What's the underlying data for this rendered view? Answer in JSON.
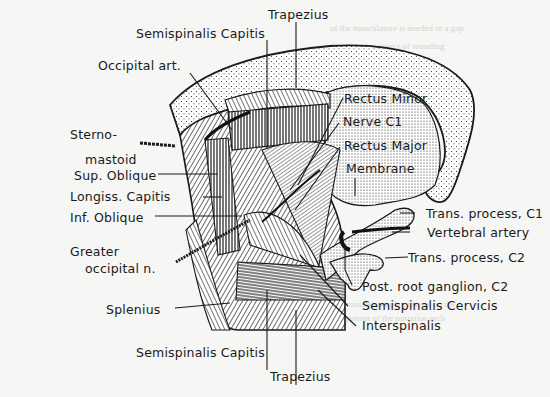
{
  "figure": {
    "labels": {
      "trapezius_top": "Trapezius",
      "semispinalis_capitis_top": "Semispinalis Capitis",
      "occipital_art": "Occipital art.",
      "sternomastoid_1": "Sterno-",
      "sternomastoid_2": "mastoid",
      "sup_oblique": "Sup. Oblique",
      "longiss_capitis": "Longiss. Capitis",
      "inf_oblique": "Inf. Oblique",
      "greater_occipital_1": "Greater",
      "greater_occipital_2": "occipital n.",
      "splenius": "Splenius",
      "semispinalis_capitis_bottom": "Semispinalis Capitis",
      "trapezius_bottom": "Trapezius",
      "rectus_minor": "Rectus Minor",
      "nerve_c1": "Nerve C1",
      "rectus_major": "Rectus Major",
      "membrane": "Membrane",
      "trans_process_c1": "Trans. process, C1",
      "vertebral_artery": "Vertebral artery",
      "trans_process_c2": "Trans. process, C2",
      "post_root_ganglion": "Post. root ganglion, C2",
      "semispinalis_cervicis": "Semispinalis Cervicis",
      "interspinalis": "Interspinalis"
    }
  },
  "colors": {
    "ink": "#1a1a1a",
    "paper": "#f6f6f4",
    "bleed": "#d4d4d0"
  }
}
